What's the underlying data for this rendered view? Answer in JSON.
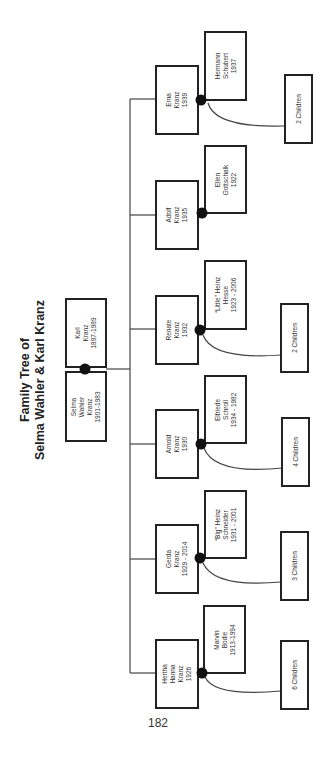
{
  "title": {
    "line1": "Family Tree of",
    "line2": "Selma Wahler & Karl Kranz"
  },
  "parents": [
    {
      "id": "karl",
      "lines": [
        "Karl",
        "Kranz",
        "1897-1989"
      ]
    },
    {
      "id": "selma",
      "lines": [
        "Selma",
        "Wahler",
        "Kranz",
        "1901-1983"
      ]
    }
  ],
  "children": [
    {
      "id": "erna",
      "lines": [
        "Erna",
        "Kranz",
        "1939"
      ],
      "spouse": [
        "Hermann",
        "Schubert",
        "1937"
      ],
      "offspring": "2 Children"
    },
    {
      "id": "adolf",
      "lines": [
        "Adolf",
        "Kranz",
        "1935"
      ],
      "spouse": [
        "Ellen",
        "Gottschalk",
        "1922"
      ],
      "offspring": null
    },
    {
      "id": "renate",
      "lines": [
        "Renate",
        "Kranz",
        "1932"
      ],
      "spouse": [
        "“Little” Heinz",
        "Hesse",
        "1923 - 2006"
      ],
      "offspring": "2 Children"
    },
    {
      "id": "arnold",
      "lines": [
        "Arnold",
        "Kranz",
        "1930"
      ],
      "spouse": [
        "Elfriede",
        "Schroll",
        "1934 - 1982"
      ],
      "offspring": "4 Children"
    },
    {
      "id": "gerda",
      "lines": [
        "Gerda",
        "Kranz",
        "1929 - 2014"
      ],
      "spouse": [
        "“Big” Heinz",
        "Schneider",
        "1931 - 2001"
      ],
      "offspring": "3 Children"
    },
    {
      "id": "hertha",
      "lines": [
        "Hertha",
        "Hanna",
        "Kranz",
        "1926"
      ],
      "spouse": [
        "Marvin",
        "Bodie",
        "1913-1994"
      ],
      "offspring": "6 Children"
    }
  ],
  "page_number": "182",
  "colors": {
    "line": "#222222",
    "dot": "#111111",
    "background": "#ffffff"
  }
}
